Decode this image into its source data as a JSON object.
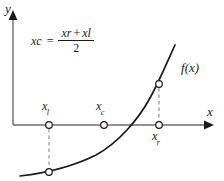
{
  "figure": {
    "type": "math-diagram",
    "background_color": "#ffffff",
    "ink_color": "#1a1a1a",
    "axis_color": "#6b6b6b",
    "dash_color": "#8a8a8a"
  },
  "axes": {
    "y_label": "y",
    "x_label": "x",
    "origin_px": {
      "x": 13,
      "y": 125
    },
    "x_axis_y_px": 125,
    "y_axis_x_px": 13,
    "x_axis_end_px": 205,
    "y_axis_top_px": 12
  },
  "formula": {
    "lhs_base": "x",
    "lhs_sub": "c",
    "equals": "=",
    "numerator_first_base": "x",
    "numerator_first_sub": "r",
    "numerator_plus": "+",
    "numerator_second_base": "x",
    "numerator_second_sub": "l",
    "denominator": "2",
    "full_text": "x_c = (x_r + x_l) / 2"
  },
  "curve": {
    "label_base": "f",
    "label_args": "(x)",
    "label_full": "f(x)",
    "shape": "increasing-convex",
    "root_x_px": 127,
    "path": "M 20,176 C 46,173 74,166 96,155 C 118,143 138,120 150,98 C 160,80 168,60 175,45"
  },
  "points": [
    {
      "id": "xl-axis",
      "label_base": "x",
      "label_sub": "l",
      "label_full": "x_l",
      "on": "x-axis",
      "x_px": 49,
      "y_px": 125,
      "label_position": "above"
    },
    {
      "id": "xc-axis",
      "label_base": "x",
      "label_sub": "c",
      "label_full": "x_c",
      "on": "x-axis",
      "x_px": 104,
      "y_px": 125,
      "label_position": "above"
    },
    {
      "id": "xr-axis",
      "label_base": "x",
      "label_sub": "r",
      "label_full": "x_r",
      "on": "x-axis",
      "x_px": 159,
      "y_px": 125,
      "label_position": "below"
    },
    {
      "id": "xl-curve",
      "label_full": "",
      "on": "curve",
      "x_px": 49,
      "y_px": 172,
      "label_position": "none"
    },
    {
      "id": "xr-curve",
      "label_full": "",
      "on": "curve",
      "x_px": 159,
      "y_px": 84,
      "label_position": "none"
    }
  ],
  "connectors": [
    {
      "id": "xl-dashed",
      "from_x": 49,
      "from_y": 128,
      "to_x": 49,
      "to_y": 169
    },
    {
      "id": "xr-dashed",
      "from_x": 159,
      "from_y": 87,
      "to_x": 159,
      "to_y": 122
    }
  ]
}
